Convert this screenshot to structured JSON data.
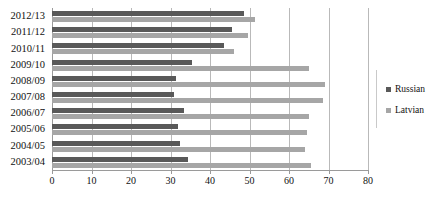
{
  "chart_data": {
    "type": "bar",
    "orientation": "horizontal",
    "title": "",
    "xlabel": "",
    "ylabel": "",
    "xlim": [
      0,
      80
    ],
    "xticks": [
      0,
      10,
      20,
      30,
      40,
      50,
      60,
      70,
      80
    ],
    "grid": true,
    "legend_position": "right",
    "categories": [
      "2012/13",
      "2011/12",
      "2010/11",
      "2009/10",
      "2008/09",
      "2007/08",
      "2006/07",
      "2005/06",
      "2004/05",
      "2003/04"
    ],
    "series": [
      {
        "name": "Russian",
        "color": "#595959",
        "values": [
          48.5,
          45.5,
          43.5,
          35.5,
          31.5,
          31.0,
          33.5,
          32.0,
          32.5,
          34.5
        ]
      },
      {
        "name": "Latvian",
        "color": "#a6a6a6",
        "values": [
          51.5,
          49.5,
          46.0,
          65.0,
          69.0,
          68.5,
          65.0,
          64.5,
          64.0,
          65.5
        ]
      }
    ]
  },
  "legend": {
    "items": [
      {
        "label": "Russian",
        "color": "#595959",
        "marker": "square-marker"
      },
      {
        "label": "Latvian",
        "color": "#a6a6a6",
        "marker": "square-marker"
      }
    ]
  },
  "axis": {
    "x_tick_labels": [
      "0",
      "10",
      "20",
      "30",
      "40",
      "50",
      "60",
      "70",
      "80"
    ]
  }
}
